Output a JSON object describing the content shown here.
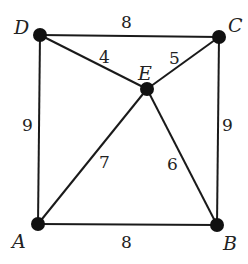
{
  "graph": {
    "vertices": [
      {
        "id": "A",
        "label": "A",
        "x": 38,
        "y": 224
      },
      {
        "id": "B",
        "label": "B",
        "x": 217,
        "y": 225
      },
      {
        "id": "C",
        "label": "C",
        "x": 219,
        "y": 37
      },
      {
        "id": "D",
        "label": "D",
        "x": 40,
        "y": 35
      },
      {
        "id": "E",
        "label": "E",
        "x": 147,
        "y": 89
      }
    ],
    "edges": [
      {
        "from": "D",
        "to": "C",
        "weight": "8"
      },
      {
        "from": "D",
        "to": "E",
        "weight": "4"
      },
      {
        "from": "E",
        "to": "C",
        "weight": "5"
      },
      {
        "from": "D",
        "to": "A",
        "weight": "9"
      },
      {
        "from": "C",
        "to": "B",
        "weight": "9"
      },
      {
        "from": "A",
        "to": "E",
        "weight": "7"
      },
      {
        "from": "E",
        "to": "B",
        "weight": "6"
      },
      {
        "from": "A",
        "to": "B",
        "weight": "8"
      }
    ]
  },
  "labels": {
    "vertex_A": "A",
    "vertex_B": "B",
    "vertex_C": "C",
    "vertex_D": "D",
    "vertex_E": "E",
    "edge_DC": "8",
    "edge_DE": "4",
    "edge_EC": "5",
    "edge_DA": "9",
    "edge_CB": "9",
    "edge_AE": "7",
    "edge_EB": "6",
    "edge_AB": "8"
  }
}
